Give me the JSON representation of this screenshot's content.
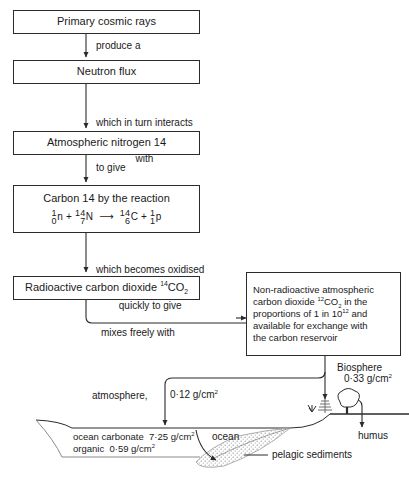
{
  "flow": {
    "boxes": [
      {
        "id": "primary-cosmic-rays",
        "text": "Primary cosmic rays"
      },
      {
        "id": "neutron-flux",
        "text": "Neutron flux"
      },
      {
        "id": "atmospheric-nitrogen-14",
        "text": "Atmospheric nitrogen 14"
      },
      {
        "id": "carbon-14-reaction",
        "text": "Carbon 14 by the reaction",
        "equation": "¹₀n + ¹⁴₇N → ¹⁴₆C + ¹₁p"
      },
      {
        "id": "radioactive-carbon-dioxide",
        "text": "Radioactive carbon dioxide ¹⁴CO₂"
      }
    ],
    "connector_labels": [
      {
        "id": "produce-a",
        "text": "produce a"
      },
      {
        "id": "which-in-turn-interacts-with",
        "line1": "which in turn interacts",
        "line2": "with"
      },
      {
        "id": "to-give",
        "text": "to give"
      },
      {
        "id": "which-becomes-oxidised-quickly-to-give",
        "line1": "which becomes oxidised",
        "line2": "quickly to give"
      },
      {
        "id": "mixes-freely-with",
        "text": "mixes freely with"
      }
    ]
  },
  "reservoir_box": {
    "id": "non-radioactive-atmospheric-co2",
    "lines": [
      "Non-radioactive atmospheric",
      "carbon dioxide ¹²CO₂ in the",
      "proportions of 1 in 10¹² and",
      "available for exchange with",
      "the carbon reservoir"
    ]
  },
  "reservoirs": {
    "atmosphere": {
      "label": "atmosphere,",
      "value": "0·12 g/cm²"
    },
    "biosphere": {
      "label": "Biosphere",
      "value": "0·33 g/cm²"
    },
    "humus": {
      "label": "humus"
    },
    "ocean": {
      "label": "ocean"
    },
    "ocean_carbonate": {
      "label": "ocean carbonate",
      "value": "7·25 g/cm²"
    },
    "ocean_organic": {
      "label": "organic",
      "value": "0·59 g/cm²"
    },
    "pelagic_sediments": {
      "label": "pelagic sediments"
    }
  },
  "style": {
    "ink": "#2b2b2b",
    "paper": "#ffffff",
    "sediment_fill": "#d8d8d8"
  }
}
